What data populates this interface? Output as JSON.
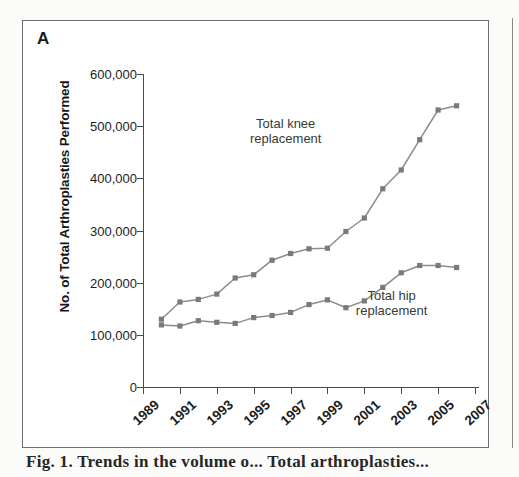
{
  "panel": {
    "label": "A"
  },
  "caption": {
    "text": "Fig. 1. Trends in the volume o... Total arthroplasties..."
  },
  "axes": {
    "y_title": "No. of Total Arthroplasties Performed",
    "y_ticks": [
      "600,000",
      "500,000",
      "400,000",
      "300,000",
      "200,000",
      "100,000",
      "0"
    ],
    "x_ticks": [
      "1989",
      "1991",
      "1993",
      "1995",
      "1997",
      "1999",
      "2001",
      "2003",
      "2005",
      "2007"
    ]
  },
  "annotations": {
    "knee_label_line1": "Total knee",
    "knee_label_line2": "replacement",
    "hip_label_line1": "Total hip",
    "hip_label_line2": "replacement"
  },
  "colors": {
    "series": "#8c8c8a",
    "marker": "#7a7a78",
    "axis": "#4a4a48",
    "panel_border": "#6e6e6c",
    "text": "#1b1b1b"
  },
  "chart_data": {
    "type": "line",
    "title": "",
    "xlabel": "",
    "ylabel": "No. of Total Arthroplasties Performed",
    "xlim": [
      1989,
      2007
    ],
    "ylim": [
      0,
      600000
    ],
    "ytick_values": [
      0,
      100000,
      200000,
      300000,
      400000,
      500000,
      600000
    ],
    "xtick_values": [
      1989,
      1991,
      1993,
      1995,
      1997,
      1999,
      2001,
      2003,
      2005,
      2007
    ],
    "grid": false,
    "legend": "inline-annotation",
    "x": [
      1990,
      1991,
      1992,
      1993,
      1994,
      1995,
      1996,
      1997,
      1998,
      1999,
      2000,
      2001,
      2002,
      2003,
      2004,
      2005,
      2006
    ],
    "series": [
      {
        "name": "Total knee replacement",
        "values": [
          130000,
          163000,
          168000,
          178000,
          209000,
          215000,
          243000,
          256000,
          265000,
          266000,
          298000,
          324000,
          380000,
          416000,
          474000,
          531000,
          539000
        ]
      },
      {
        "name": "Total hip replacement",
        "values": [
          119000,
          117000,
          127000,
          124000,
          122000,
          133000,
          137000,
          143000,
          158000,
          167000,
          152000,
          165000,
          191000,
          219000,
          233000,
          233000,
          229000
        ]
      }
    ]
  }
}
